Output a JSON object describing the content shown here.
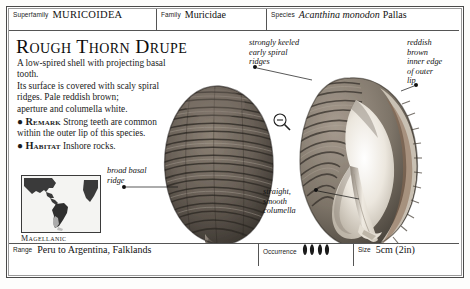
{
  "taxonomy": {
    "superfamily": {
      "key": "Superfamily",
      "value": "MURICOIDEA"
    },
    "family": {
      "key": "Family",
      "value": "Muricidae"
    },
    "species": {
      "key": "Species",
      "genus_species": "Acanthina monodon",
      "author": "Pallas"
    }
  },
  "title": "Rough Thorn Drupe",
  "description": {
    "line1": "A low-spired shell with projecting basal tooth.",
    "line2": "Its surface is covered with scaly spiral",
    "line3": "ridges. Pale reddish brown;",
    "line4": "aperture and columella white.",
    "remark_keyword": "Remark",
    "remark_text": "Strong teeth are common within the outer lip of this species.",
    "habitat_keyword": "Habitat",
    "habitat_text": "Inshore rocks."
  },
  "map": {
    "label": "Magellanic"
  },
  "annotations": {
    "keeled_ridges": "strongly keeled\nearly spiral\nridges",
    "reddish_lip": "reddish\nbrown\ninner edge\nof outer\nlip",
    "basal_ridge": "broad basal\nridge",
    "columella": "straight,\nsmooth\ncolumella"
  },
  "magnifier": {
    "icon": "magnifier-minus-icon"
  },
  "footer": {
    "range": {
      "key": "Range",
      "value": "Peru to Argentina, Falklands"
    },
    "occurrence": {
      "key": "Occurrence",
      "count": 4,
      "icon": "shell-icon"
    },
    "size": {
      "key": "Size",
      "value": "5cm (2in)"
    }
  },
  "colors": {
    "frame": "#4a4a4a",
    "rule": "#555555",
    "text": "#111111",
    "shell_dark": "#6b6158",
    "shell_light": "#d9d2c6"
  }
}
